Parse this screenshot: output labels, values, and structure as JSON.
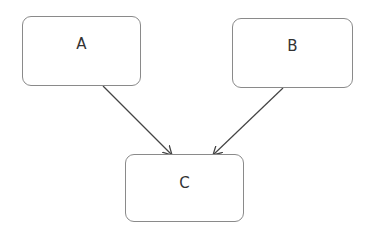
{
  "diagram": {
    "nodes": [
      {
        "id": "A",
        "label": "A"
      },
      {
        "id": "B",
        "label": "B"
      },
      {
        "id": "C",
        "label": "C"
      }
    ],
    "edges": [
      {
        "from": "A",
        "to": "C"
      },
      {
        "from": "B",
        "to": "C"
      }
    ],
    "colors": {
      "border": "#8a8a8a",
      "edge": "#444444",
      "text": "#333333"
    }
  }
}
